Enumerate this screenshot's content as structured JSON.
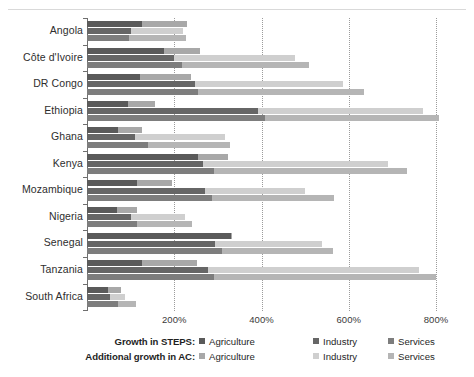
{
  "chart_data": {
    "type": "bar",
    "orientation": "horizontal",
    "title": "",
    "xlabel": "",
    "ylabel": "",
    "grid": true,
    "legend_position": "bottom",
    "xlim": [
      0,
      820
    ],
    "xticks": [
      200,
      400,
      600,
      800
    ],
    "xticklabels": [
      "200%",
      "400%",
      "600%",
      "800%"
    ],
    "categories": [
      "Angola",
      "Côte d'Ivoire",
      "DR Congo",
      "Ethiopia",
      "Ghana",
      "Kenya",
      "Mozambique",
      "Nigeria",
      "Senegal",
      "Tanzania",
      "South Africa"
    ],
    "series": [
      {
        "name": "Growth in STEPS: Agriculture",
        "key": "steps_agriculture",
        "color": "#5a5a5a",
        "values": [
          126,
          176,
          121,
          95,
          70,
          254,
          114,
          68,
          329,
          127,
          47
        ]
      },
      {
        "name": "Growth in STEPS: Industry",
        "key": "steps_industry",
        "color": "#666666",
        "values": [
          100,
          199,
          247,
          393,
          110,
          265,
          270,
          100,
          293,
          277,
          52
        ]
      },
      {
        "name": "Growth in STEPS: Services",
        "key": "steps_services",
        "color": "#7d7d7d",
        "values": [
          97,
          217,
          254,
          407,
          140,
          292,
          286,
          114,
          309,
          291,
          70
        ]
      },
      {
        "name": "Additional growth in AC: Agriculture",
        "key": "ac_agriculture",
        "color": "#a8a8a8",
        "values": [
          103,
          83,
          117,
          62,
          57,
          69,
          80,
          46,
          3,
          124,
          32
        ]
      },
      {
        "name": "Additional growth in AC: Industry",
        "key": "ac_industry",
        "color": "#cfcfcf",
        "values": [
          119,
          277,
          339,
          378,
          206,
          426,
          229,
          124,
          245,
          484,
          34
        ]
      },
      {
        "name": "Additional growth in AC: Services",
        "key": "ac_services",
        "color": "#b5b5b5",
        "values": [
          131,
          291,
          380,
          399,
          188,
          442,
          280,
          126,
          254,
          509,
          43
        ]
      }
    ],
    "stacks": [
      {
        "category": "Angola",
        "bars": [
          {
            "group": "Agriculture",
            "base": 126,
            "additional": 103,
            "total": 229
          },
          {
            "group": "Industry",
            "base": 100,
            "additional": 119,
            "total": 219
          },
          {
            "group": "Services",
            "base": 97,
            "additional": 131,
            "total": 228
          }
        ]
      },
      {
        "category": "Côte d'Ivoire",
        "bars": [
          {
            "group": "Agriculture",
            "base": 176,
            "additional": 83,
            "total": 259
          },
          {
            "group": "Industry",
            "base": 199,
            "additional": 277,
            "total": 476
          },
          {
            "group": "Services",
            "base": 217,
            "additional": 291,
            "total": 508
          }
        ]
      },
      {
        "category": "DR Congo",
        "bars": [
          {
            "group": "Agriculture",
            "base": 121,
            "additional": 117,
            "total": 238
          },
          {
            "group": "Industry",
            "base": 247,
            "additional": 339,
            "total": 586
          },
          {
            "group": "Services",
            "base": 254,
            "additional": 380,
            "total": 634
          }
        ]
      },
      {
        "category": "Ethiopia",
        "bars": [
          {
            "group": "Agriculture",
            "base": 95,
            "additional": 62,
            "total": 157
          },
          {
            "group": "Industry",
            "base": 393,
            "additional": 378,
            "total": 771
          },
          {
            "group": "Services",
            "base": 407,
            "additional": 399,
            "total": 806
          }
        ]
      },
      {
        "category": "Ghana",
        "bars": [
          {
            "group": "Agriculture",
            "base": 70,
            "additional": 57,
            "total": 127
          },
          {
            "group": "Industry",
            "base": 110,
            "additional": 206,
            "total": 316
          },
          {
            "group": "Services",
            "base": 140,
            "additional": 188,
            "total": 328
          }
        ]
      },
      {
        "category": "Kenya",
        "bars": [
          {
            "group": "Agriculture",
            "base": 254,
            "additional": 69,
            "total": 323
          },
          {
            "group": "Industry",
            "base": 265,
            "additional": 426,
            "total": 691
          },
          {
            "group": "Services",
            "base": 292,
            "additional": 442,
            "total": 734
          }
        ]
      },
      {
        "category": "Mozambique",
        "bars": [
          {
            "group": "Agriculture",
            "base": 114,
            "additional": 80,
            "total": 194
          },
          {
            "group": "Industry",
            "base": 270,
            "additional": 229,
            "total": 499
          },
          {
            "group": "Services",
            "base": 286,
            "additional": 280,
            "total": 566
          }
        ]
      },
      {
        "category": "Nigeria",
        "bars": [
          {
            "group": "Agriculture",
            "base": 68,
            "additional": 46,
            "total": 114
          },
          {
            "group": "Industry",
            "base": 100,
            "additional": 124,
            "total": 224
          },
          {
            "group": "Services",
            "base": 114,
            "additional": 126,
            "total": 240
          }
        ]
      },
      {
        "category": "Senegal",
        "bars": [
          {
            "group": "Agriculture",
            "base": 329,
            "additional": 3,
            "total": 332
          },
          {
            "group": "Industry",
            "base": 293,
            "additional": 245,
            "total": 538
          },
          {
            "group": "Services",
            "base": 309,
            "additional": 254,
            "total": 563
          }
        ]
      },
      {
        "category": "Tanzania",
        "bars": [
          {
            "group": "Agriculture",
            "base": 127,
            "additional": 124,
            "total": 251
          },
          {
            "group": "Industry",
            "base": 277,
            "additional": 484,
            "total": 761
          },
          {
            "group": "Services",
            "base": 291,
            "additional": 509,
            "total": 800
          }
        ]
      },
      {
        "category": "South Africa",
        "bars": [
          {
            "group": "Agriculture",
            "base": 47,
            "additional": 32,
            "total": 79
          },
          {
            "group": "Industry",
            "base": 52,
            "additional": 34,
            "total": 86
          },
          {
            "group": "Services",
            "base": 70,
            "additional": 43,
            "total": 113
          }
        ]
      }
    ]
  },
  "legend": {
    "rows": [
      {
        "title": "Growth in STEPS:",
        "items": [
          {
            "label": "Agriculture",
            "color": "#5a5a5a"
          },
          {
            "label": "Industry",
            "color": "#666666"
          },
          {
            "label": "Services",
            "color": "#7d7d7d"
          }
        ]
      },
      {
        "title": "Additional growth in AC:",
        "items": [
          {
            "label": "Agriculture",
            "color": "#a8a8a8"
          },
          {
            "label": "Industry",
            "color": "#cfcfcf"
          },
          {
            "label": "Services",
            "color": "#b5b5b5"
          }
        ]
      }
    ]
  },
  "colors": {
    "steps_agriculture": "#5a5a5a",
    "steps_industry": "#666666",
    "steps_services": "#7d7d7d",
    "ac_agriculture": "#a8a8a8",
    "ac_industry": "#cfcfcf",
    "ac_services": "#b5b5b5",
    "axis": "#6f6f6f",
    "grid": "#9b9b9b",
    "text": "#2e2e2e"
  }
}
